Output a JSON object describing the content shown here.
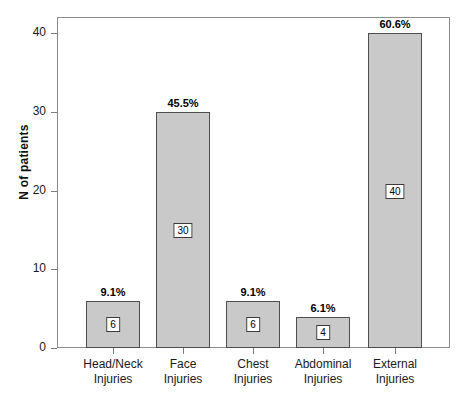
{
  "chart_data": {
    "type": "bar",
    "title": "",
    "xlabel": "",
    "ylabel": "N of patients",
    "ylim": [
      0,
      42
    ],
    "yticks": [
      0,
      10,
      20,
      30,
      40
    ],
    "grid": false,
    "legend": "none",
    "categories": [
      "Head/Neck Injuries",
      "Face Injuries",
      "Chest Injuries",
      "Abdominal Injuries",
      "External Injuries"
    ],
    "category_lines": [
      [
        "Head/Neck",
        "Injuries"
      ],
      [
        "Face",
        "Injuries"
      ],
      [
        "Chest",
        "Injuries"
      ],
      [
        "Abdominal",
        "Injuries"
      ],
      [
        "External",
        "Injuries"
      ]
    ],
    "values": [
      6,
      30,
      6,
      4,
      40
    ],
    "value_labels": [
      "6",
      "30",
      "6",
      "4",
      "40"
    ],
    "percent_labels": [
      "9.1%",
      "45.5%",
      "9.1%",
      "6.1%",
      "60.6%"
    ],
    "percent_values": [
      9.1,
      45.5,
      9.1,
      6.1,
      60.6
    ],
    "bar_fill_color": "#c9c9c9",
    "bar_border_color": "#4d4d4d",
    "axis_color": "#7a7a7a",
    "text_color": "#1a1a1a"
  },
  "caption": ""
}
